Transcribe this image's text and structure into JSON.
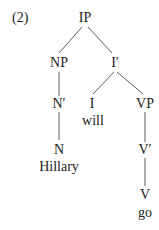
{
  "example_number": "(2)",
  "tree": {
    "nodes": {
      "ip": "IP",
      "np": "NP",
      "ibar": "I′",
      "nbar": "N′",
      "i": "I",
      "vp": "VP",
      "n": "N",
      "vbar": "V′",
      "v": "V"
    },
    "words": {
      "will": "will",
      "hillary": "Hillary",
      "go": "go"
    },
    "edges": [
      [
        "IP",
        "NP"
      ],
      [
        "IP",
        "I′"
      ],
      [
        "NP",
        "N′"
      ],
      [
        "N′",
        "N"
      ],
      [
        "I′",
        "I"
      ],
      [
        "I′",
        "VP"
      ],
      [
        "VP",
        "V′"
      ],
      [
        "V′",
        "V"
      ]
    ]
  }
}
